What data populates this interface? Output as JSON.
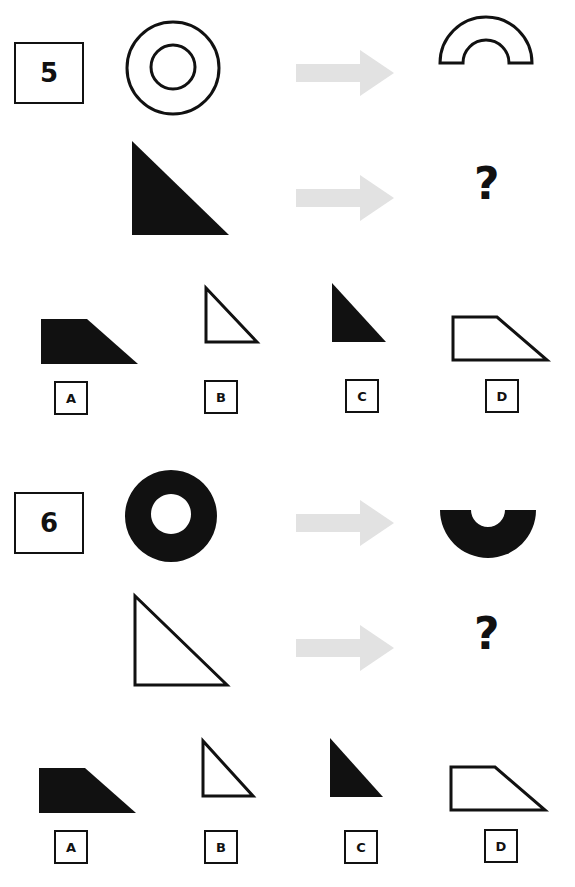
{
  "puzzles": [
    {
      "number": "5",
      "example": {
        "source": "outlined double circle (ring outline)",
        "result": "outlined upper half ring (arch)"
      },
      "question": {
        "source": "filled black right triangle",
        "result": "?"
      },
      "options": [
        {
          "label": "A",
          "shape": "filled black trapezoid"
        },
        {
          "label": "B",
          "shape": "outlined small right triangle"
        },
        {
          "label": "C",
          "shape": "filled black small right triangle"
        },
        {
          "label": "D",
          "shape": "outlined trapezoid"
        }
      ]
    },
    {
      "number": "6",
      "example": {
        "source": "filled black ring",
        "result": "filled black lower half ring"
      },
      "question": {
        "source": "outlined right triangle",
        "result": "?"
      },
      "options": [
        {
          "label": "A",
          "shape": "filled black trapezoid"
        },
        {
          "label": "B",
          "shape": "outlined small right triangle"
        },
        {
          "label": "C",
          "shape": "filled black small right triangle"
        },
        {
          "label": "D",
          "shape": "outlined trapezoid"
        }
      ]
    }
  ],
  "arrow_color": "#e2e2e2",
  "ink_color": "#111111"
}
